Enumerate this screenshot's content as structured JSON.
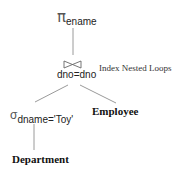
{
  "diagram": {
    "type": "query-evaluation-plan",
    "projection": {
      "symbol": "π",
      "subscript": "ename"
    },
    "join": {
      "symbol": "⋈",
      "condition": "dno=dno",
      "annotation": "Index Nested Loops"
    },
    "selection": {
      "symbol": "σ",
      "subscript": "dname='Toy'"
    },
    "leaves": {
      "left": "Department",
      "right": "Employee"
    },
    "colors": {
      "text": "#222222",
      "edge": "#9a9a9a",
      "background": "#ffffff"
    }
  }
}
